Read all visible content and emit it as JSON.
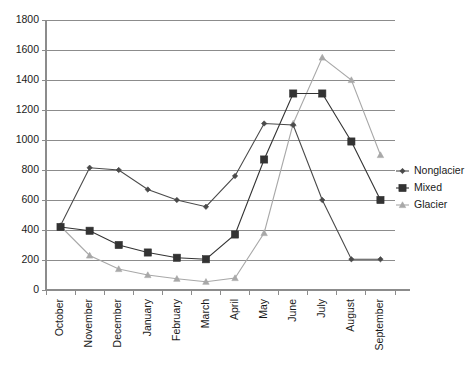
{
  "chart_data": {
    "type": "line",
    "title": "",
    "xlabel": "",
    "ylabel": "",
    "categories": [
      "October",
      "November",
      "December",
      "January",
      "February",
      "March",
      "April",
      "May",
      "June",
      "July",
      "August",
      "September"
    ],
    "ylim": [
      0,
      1800
    ],
    "yticks": [
      0,
      200,
      400,
      600,
      800,
      1000,
      1200,
      1400,
      1600,
      1800
    ],
    "grid": true,
    "legend_position": "right",
    "series": [
      {
        "name": "Nonglacier",
        "marker": "diamond",
        "color": "#4a4a4a",
        "values": [
          430,
          815,
          800,
          670,
          600,
          555,
          760,
          1110,
          1100,
          600,
          205,
          205
        ]
      },
      {
        "name": "Mixed",
        "marker": "square",
        "color": "#333333",
        "values": [
          420,
          395,
          300,
          250,
          215,
          205,
          370,
          870,
          1310,
          1310,
          990,
          600
        ]
      },
      {
        "name": "Glacier",
        "marker": "triangle",
        "color": "#a8a8a8",
        "values": [
          425,
          230,
          140,
          100,
          75,
          55,
          80,
          380,
          1110,
          1550,
          1400,
          900
        ]
      }
    ]
  },
  "legend": {
    "items": [
      {
        "label": "Nonglacier"
      },
      {
        "label": "Mixed"
      },
      {
        "label": "Glacier"
      }
    ]
  },
  "axes": {
    "y_tick_labels": [
      "1800",
      "1600",
      "1400",
      "1200",
      "1000",
      "800",
      "600",
      "400",
      "200",
      "0"
    ],
    "x_tick_labels": [
      "October",
      "November",
      "December",
      "January",
      "February",
      "March",
      "April",
      "May",
      "June",
      "July",
      "August",
      "September"
    ]
  }
}
